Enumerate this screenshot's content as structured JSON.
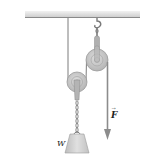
{
  "diagram": {
    "type": "pulley-system",
    "labels": {
      "weight": "W",
      "force": "F"
    },
    "force_vector_arrow": "→",
    "colors": {
      "ceiling": "#c9c9c9",
      "ceiling_edge": "#8a8a8a",
      "rope": "#6e6e6e",
      "pulley_fill": "#c4c4c4",
      "pulley_edge": "#9a9a9a",
      "pulley_hub": "#e2e2e2",
      "weight_fill": "#cfcfcf",
      "arrow": "#8c8c8c",
      "text": "#222222"
    },
    "elements": [
      {
        "name": "ceiling"
      },
      {
        "name": "hook"
      },
      {
        "name": "fixed-upper-pulley"
      },
      {
        "name": "movable-lower-pulley"
      },
      {
        "name": "rope"
      },
      {
        "name": "chain"
      },
      {
        "name": "weight-block",
        "label": "W"
      },
      {
        "name": "applied-force-arrow",
        "label": "F",
        "direction": "down"
      }
    ]
  }
}
